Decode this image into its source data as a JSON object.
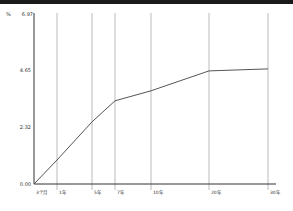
{
  "chart_data": {
    "type": "line",
    "title": "",
    "xlabel": "",
    "ylabel": "%",
    "categories": [
      "3个月",
      "1年",
      "5年",
      "7年",
      "10年",
      "20年",
      "30年"
    ],
    "series": [
      {
        "name": "yield",
        "values": [
          0.0,
          0.98,
          2.53,
          3.39,
          3.8,
          4.61,
          4.69
        ]
      }
    ],
    "y_ticks": [
      "0.00",
      "2.32",
      "4.65",
      "6.97"
    ],
    "ylim": [
      0,
      6.97
    ],
    "grid": {
      "vertical": true,
      "horizontal": false
    },
    "legend": "none"
  },
  "axis": {
    "unit_label": "%",
    "y_tick_labels": [
      "6.97",
      "4.65",
      "2.32",
      "0.00"
    ],
    "x_tick_labels": [
      "3个月",
      "1年",
      "5年",
      "7年",
      "10年",
      "20年",
      "30年"
    ]
  },
  "colors": {
    "line": "#555555",
    "grid": "#bbbbbb",
    "axis": "#333333",
    "top_bar": "#1a1a1a"
  }
}
